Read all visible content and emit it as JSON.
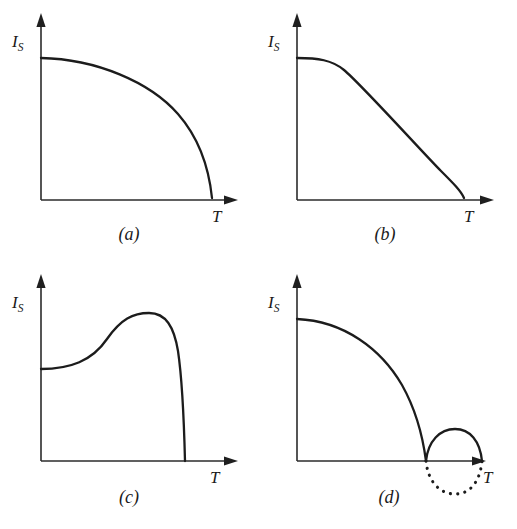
{
  "figure": {
    "background_color": "#ffffff",
    "line_color": "#1c1c1c",
    "panel_count": 4
  },
  "panels": [
    {
      "caption": "(a)",
      "y_axis_label_main": "I",
      "y_axis_label_sub": "S",
      "x_axis_label": "T",
      "description": "convex decreasing quarter-circle curve reaching zero with vertical tangent",
      "curve_path": "M 41,58 C 96,59 150,82 178,114 C 199,138 209,169 212,198",
      "dotted_path": ""
    },
    {
      "caption": "(b)",
      "y_axis_label_main": "I",
      "y_axis_label_sub": "S",
      "x_axis_label": "T",
      "description": "flat shoulder then nearly straight descent with rounded knee to zero",
      "curve_path": "M 41,58 C 62,58 76,60 88,70 C 104,83 168,154 185,171 C 198,184 205,191 208,198",
      "dotted_path": ""
    },
    {
      "caption": "(c)",
      "y_axis_label_main": "I",
      "y_axis_label_sub": "S",
      "x_axis_label": "T",
      "description": "rises from finite value to a maximum then drops steeply to zero",
      "curve_path": "M 41,108 C 70,108 92,100 107,78 C 121,58 133,52 149,52 C 166,52 174,66 178,90 C 182,117 184,160 185,200",
      "dotted_path": ""
    },
    {
      "caption": "(d)",
      "y_axis_label_main": "I",
      "y_axis_label_sub": "S",
      "x_axis_label": "T",
      "description": "main decreasing curve to zero plus small solid bump above axis and dotted arc below",
      "curve_path": "M 41,58 C 88,60 125,88 146,124 C 160,149 167,177 170,200",
      "bump_path": "M 170,200 C 172,180 184,168 199,168 C 214,168 224,180 226,200",
      "dotted_path": "M 170,200 C 172,221 184,233 199,233 C 214,233 224,221 226,200"
    }
  ],
  "geometry": {
    "origin_x": 41,
    "origin_y": 200,
    "y_axis_top": 18,
    "x_axis_right": 238
  }
}
